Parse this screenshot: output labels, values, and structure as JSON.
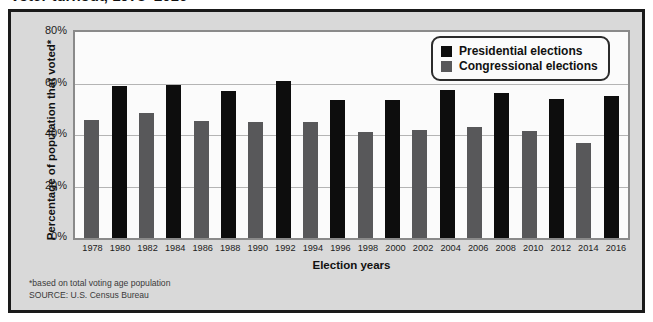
{
  "title_partial": "Voter turnout, 1978–2016",
  "axes": {
    "ylabel": "Percentage of population that voted*",
    "xlabel": "Election years",
    "yticks": [
      "80%",
      "60%",
      "40%",
      "20%",
      "0%"
    ]
  },
  "legend": {
    "position": "top-right",
    "entries": [
      {
        "label": "Presidential elections",
        "color": "#0d0d0d",
        "icon": "black-square-swatch"
      },
      {
        "label": "Congressional elections",
        "color": "#58585a",
        "icon": "gray-square-swatch"
      }
    ]
  },
  "notes": [
    "*based on total voting age population",
    "SOURCE: U.S. Census Bureau"
  ],
  "colors": {
    "presidential": "#0d0d0d",
    "congressional": "#58585a",
    "panel_background": "#d9d9d9",
    "plot_background": "#fbfbfb",
    "gridline": "#b4b4b4",
    "border": "#1a1a1a"
  },
  "chart_data": {
    "type": "bar",
    "title": "Voter turnout, 1978–2016",
    "xlabel": "Election years",
    "ylabel": "Percentage of population that voted*",
    "ylim": [
      0,
      80
    ],
    "yticks": [
      0,
      20,
      40,
      60,
      80
    ],
    "grid": true,
    "legend_position": "top-right",
    "categories": [
      "1978",
      "1980",
      "1982",
      "1984",
      "1986",
      "1988",
      "1990",
      "1992",
      "1994",
      "1996",
      "1998",
      "2000",
      "2002",
      "2004",
      "2006",
      "2008",
      "2010",
      "2012",
      "2014",
      "2016"
    ],
    "values": [
      46,
      59,
      48.5,
      59.5,
      45.5,
      57,
      45,
      61,
      45,
      53.5,
      41,
      53.5,
      42,
      57.5,
      43,
      56.5,
      41.5,
      54,
      37,
      55
    ],
    "series_of": [
      "congressional",
      "presidential",
      "congressional",
      "presidential",
      "congressional",
      "presidential",
      "congressional",
      "presidential",
      "congressional",
      "presidential",
      "congressional",
      "presidential",
      "congressional",
      "presidential",
      "congressional",
      "presidential",
      "congressional",
      "presidential",
      "congressional",
      "presidential"
    ],
    "series": [
      {
        "name": "Presidential elections",
        "color": "#0d0d0d",
        "points": [
          {
            "x": "1980",
            "y": 59
          },
          {
            "x": "1984",
            "y": 59.5
          },
          {
            "x": "1988",
            "y": 57
          },
          {
            "x": "1992",
            "y": 61
          },
          {
            "x": "1996",
            "y": 53.5
          },
          {
            "x": "2000",
            "y": 53.5
          },
          {
            "x": "2004",
            "y": 57.5
          },
          {
            "x": "2008",
            "y": 56.5
          },
          {
            "x": "2012",
            "y": 54
          },
          {
            "x": "2016",
            "y": 55
          }
        ]
      },
      {
        "name": "Congressional elections",
        "color": "#58585a",
        "points": [
          {
            "x": "1978",
            "y": 46
          },
          {
            "x": "1982",
            "y": 48.5
          },
          {
            "x": "1986",
            "y": 45.5
          },
          {
            "x": "1990",
            "y": 45
          },
          {
            "x": "1994",
            "y": 45
          },
          {
            "x": "1998",
            "y": 41
          },
          {
            "x": "2002",
            "y": 42
          },
          {
            "x": "2006",
            "y": 43
          },
          {
            "x": "2010",
            "y": 41.5
          },
          {
            "x": "2014",
            "y": 37
          }
        ]
      }
    ]
  }
}
